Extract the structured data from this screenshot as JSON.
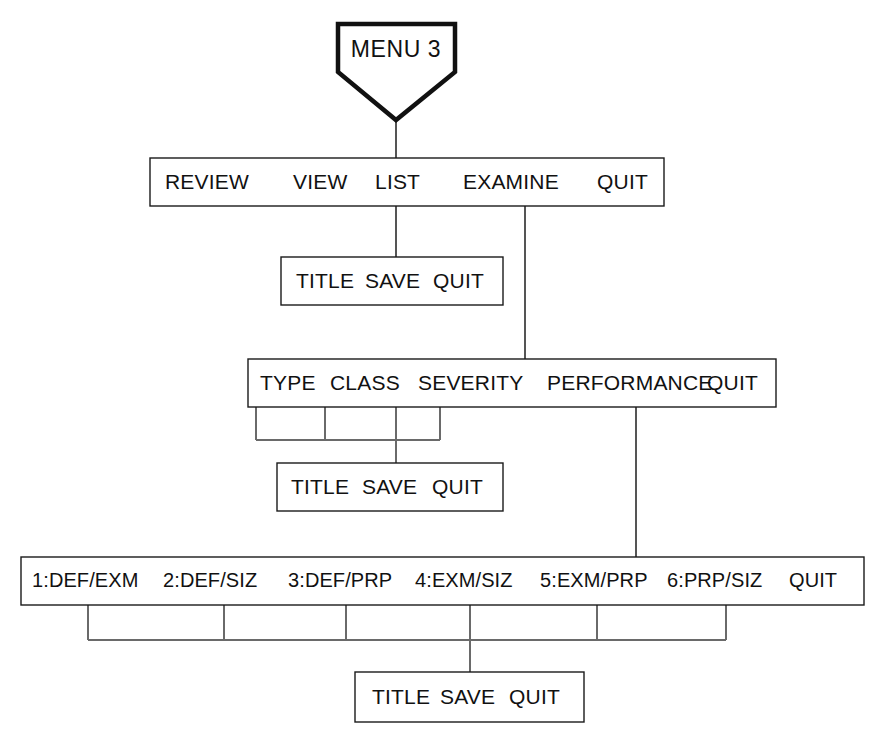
{
  "diagram": {
    "type": "menu-hierarchy-flowchart",
    "title": "MENU 3",
    "background_color": "#ffffff",
    "line_color": "#555555",
    "text_color": "#111111",
    "root": {
      "shape": "pentagon",
      "label": "MENU 3"
    },
    "levels": [
      {
        "id": "main-menu-bar",
        "name": "main-menu",
        "items": [
          {
            "label": "REVIEW"
          },
          {
            "label": "VIEW"
          },
          {
            "label": "LIST"
          },
          {
            "label": "EXAMINE"
          },
          {
            "label": "QUIT"
          }
        ]
      },
      {
        "id": "list-submenu-bar",
        "name": "list-submenu",
        "items": [
          {
            "label": "TITLE"
          },
          {
            "label": "SAVE"
          },
          {
            "label": "QUIT"
          }
        ]
      },
      {
        "id": "examine-submenu-bar",
        "name": "examine-submenu",
        "items": [
          {
            "label": "TYPE"
          },
          {
            "label": "CLASS"
          },
          {
            "label": "SEVERITY"
          },
          {
            "label": "PERFORMANCE"
          },
          {
            "label": "QUIT"
          }
        ]
      },
      {
        "id": "examine-attribute-submenu-bar",
        "name": "examine-attribute-submenu",
        "items": [
          {
            "label": "TITLE"
          },
          {
            "label": "SAVE"
          },
          {
            "label": "QUIT"
          }
        ]
      },
      {
        "id": "performance-submenu-bar",
        "name": "performance-submenu",
        "items": [
          {
            "label": "1:DEF/EXM"
          },
          {
            "label": "2:DEF/SIZ"
          },
          {
            "label": "3:DEF/PRP"
          },
          {
            "label": "4:EXM/SIZ"
          },
          {
            "label": "5:EXM/PRP"
          },
          {
            "label": "6:PRP/SIZ"
          },
          {
            "label": "QUIT"
          }
        ]
      },
      {
        "id": "performance-option-submenu-bar",
        "name": "performance-option-submenu",
        "items": [
          {
            "label": "TITLE"
          },
          {
            "label": "SAVE"
          },
          {
            "label": "QUIT"
          }
        ]
      }
    ]
  }
}
